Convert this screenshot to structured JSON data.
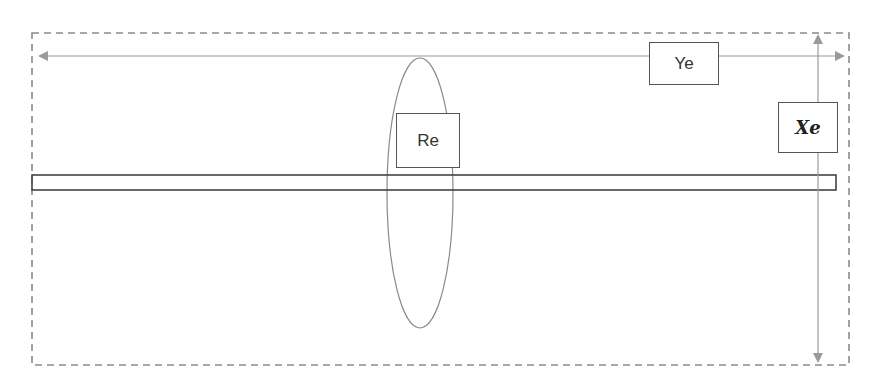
{
  "diagram": {
    "type": "schematic",
    "colors": {
      "frame": "#8a8a8a",
      "axis_arrow": "#9a9a9a",
      "bar_stroke": "#444444",
      "ellipse_stroke": "#8a8a8a",
      "box_stroke": "#555555"
    },
    "labels": {
      "ye": "Ye",
      "xe": "Xe",
      "re": "Re"
    },
    "elements": [
      {
        "id": "frame",
        "shape": "dashed-rectangle"
      },
      {
        "id": "horizontal-arrow",
        "shape": "double-headed-arrow",
        "label": "Ye"
      },
      {
        "id": "vertical-arrow",
        "shape": "double-headed-arrow",
        "label": "Xe"
      },
      {
        "id": "bar",
        "shape": "long-thin-rectangle"
      },
      {
        "id": "ellipse",
        "shape": "vertical-ellipse",
        "label": "Re"
      }
    ]
  }
}
